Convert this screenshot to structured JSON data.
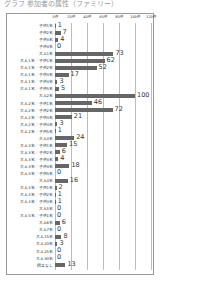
{
  "title": "グラフ 参加者の属性（ファミリー）",
  "chart_data": {
    "type": "bar",
    "orientation": "horizontal",
    "title": "グラフ 参加者の属性（ファミリー）",
    "xlabel": "",
    "ylabel": "",
    "xlim": [
      0,
      120
    ],
    "ticks": [
      "0件",
      "20件",
      "40件",
      "60件",
      "80件",
      "100件",
      "120件"
    ],
    "tick_values": [
      0,
      20,
      40,
      60,
      80,
      100,
      120
    ],
    "grid": true,
    "categories": [
      "子供1名",
      "子供2名",
      "子供3名",
      "子供4名",
      "大人1名",
      "大人1名／子供1名",
      "大人1名／子供2名",
      "大人1名／子供3名",
      "大人1名／子供4名",
      "大人1名／子供5名",
      "大人2名",
      "大人2名／子供1名",
      "大人2名／子供2名",
      "大人2名／子供3名",
      "大人2名／子供4名",
      "大人2名／子供5名",
      "大人3名",
      "大人3名／子供1名",
      "大人3名／子供2名",
      "大人3名／子供3名",
      "大人3名／子供4名",
      "大人3名／子供5名",
      "大人4名",
      "大人4名／子供1名",
      "大人4名／子供2名",
      "大人4名／子供3名",
      "大人5名",
      "大人5名／子供1名",
      "大人6名",
      "大人7名",
      "大人15名",
      "大人20名",
      "大人25名",
      "大人30名",
      "回答なし"
    ],
    "values": [
      1,
      7,
      4,
      0,
      73,
      62,
      52,
      17,
      3,
      5,
      100,
      46,
      72,
      21,
      3,
      1,
      24,
      15,
      6,
      4,
      18,
      0,
      16,
      2,
      1,
      1,
      0,
      0,
      6,
      0,
      8,
      3,
      0,
      0,
      13
    ],
    "bar_color": "#666666"
  }
}
